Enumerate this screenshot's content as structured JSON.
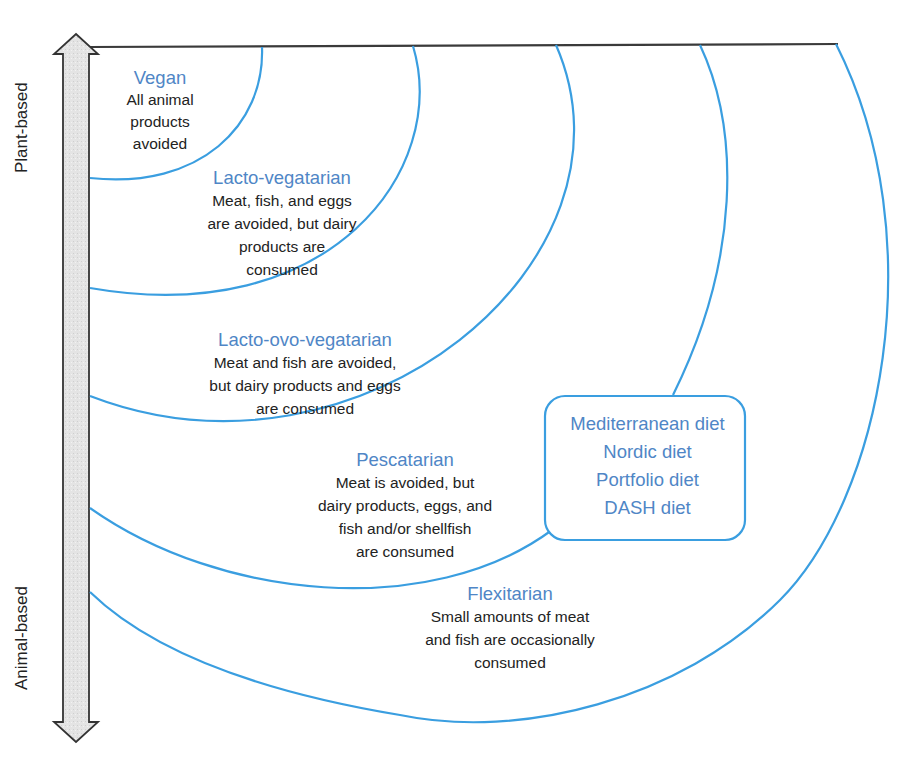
{
  "diagram": {
    "type": "nested-arc-spectrum",
    "axis": {
      "top_label": "Plant-based",
      "bottom_label": "Animal-based",
      "direction": "bidirectional-vertical"
    },
    "colors": {
      "arc": "#3a9ee0",
      "title": "#4f86c6",
      "text": "#222222",
      "arrow_fill": "#e6e6e6",
      "arrow_stroke": "#333333"
    },
    "diets": [
      {
        "id": "vegan",
        "title": "Vegan",
        "description": "All animal\nproducts\navoided"
      },
      {
        "id": "lacto-vegetarian",
        "title": "Lacto-vegatarian",
        "description": "Meat, fish, and eggs\nare avoided, but dairy\nproducts are\nconsumed"
      },
      {
        "id": "lacto-ovo-vegetarian",
        "title": "Lacto-ovo-vegatarian",
        "description": "Meat and fish are avoided,\nbut dairy products and eggs\nare consumed"
      },
      {
        "id": "pescatarian",
        "title": "Pescatarian",
        "description": "Meat is avoided, but\ndairy products, eggs, and\nfish and/or shellfish\nare consumed"
      },
      {
        "id": "flexitarian",
        "title": "Flexitarian",
        "description": "Small amounts of meat\nand fish are occasionally\nconsumed"
      }
    ],
    "patterns_box": {
      "items": [
        "Mediterranean diet",
        "Nordic diet",
        "Portfolio diet",
        "DASH diet"
      ]
    }
  }
}
